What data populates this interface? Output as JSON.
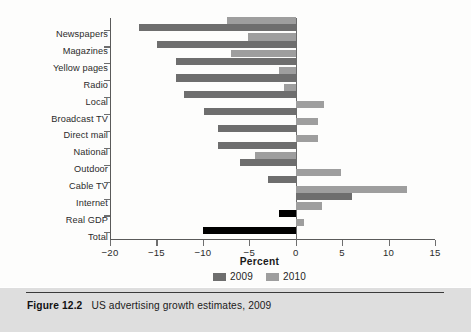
{
  "figure": {
    "caption_number": "Figure 12.2",
    "caption_text": "US advertising growth estimates, 2009",
    "background_color": "#dedede"
  },
  "legend": {
    "items": [
      {
        "label": "2009",
        "color": "#6e6e6e"
      },
      {
        "label": "2010",
        "color": "#9e9e9e"
      }
    ]
  },
  "chart_data": {
    "type": "bar",
    "orientation": "horizontal",
    "title": "",
    "xlabel": "Percent",
    "ylabel": "",
    "xlim": [
      -20,
      15
    ],
    "xticks": [
      -20,
      -15,
      -10,
      -5,
      0,
      5,
      10,
      15
    ],
    "xtick_labels": [
      "−20",
      "−15",
      "−10",
      "−5",
      "0",
      "5",
      "10",
      "15"
    ],
    "grid": false,
    "legend_position": "bottom-center",
    "categories": [
      "Newspapers",
      "Magazines",
      "Yellow pages",
      "Radio",
      "Local",
      "Broadcast TV",
      "Direct mail",
      "National",
      "Outdoor",
      "Cable TV",
      "Internet",
      "Real GDP",
      "Total"
    ],
    "series": [
      {
        "name": "2009",
        "color": "#6e6e6e",
        "values": [
          -16.9,
          -14.9,
          -12.9,
          -12.9,
          -12.0,
          -9.9,
          -8.4,
          -8.4,
          -6.0,
          -3.0,
          6.1,
          -1.8,
          -10.0
        ]
      },
      {
        "name": "2010",
        "color": "#9e9e9e",
        "values": [
          -7.4,
          -5.1,
          -7.0,
          -1.8,
          -1.3,
          3.0,
          2.4,
          2.4,
          -4.4,
          4.9,
          12.0,
          2.8,
          0.9
        ]
      }
    ],
    "highlight_rows": [
      "Real GDP",
      "Total"
    ],
    "highlight_color": "#000000",
    "highlight_note": "Real GDP 2009 bar and Total 2009 bar are rendered in solid black"
  }
}
